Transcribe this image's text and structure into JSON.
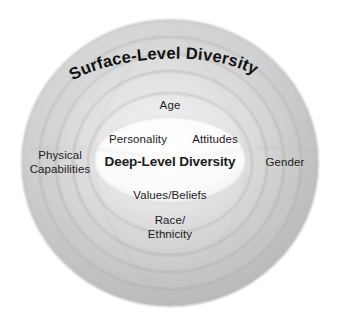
{
  "diagram": {
    "title_arc": "Surface-Level Diversity",
    "core_label": "Deep-Level Diversity",
    "inner_labels": {
      "top": "Age",
      "upper_left": "Personality",
      "upper_right": "Attitudes",
      "lower": "Values/Beliefs"
    },
    "outer_labels": {
      "left": "Physical\nCapabilities",
      "right": "Gender",
      "bottom": "Race/\nEthnicity"
    },
    "ring_count": 6,
    "colors": {
      "background": "#ffffff",
      "ring_light": "#dcdcdc",
      "ring_mid": "#c6c6c6",
      "ring_dark": "#b0b0b0",
      "ring_edge": "#949494",
      "core_fill": "#fbfbfb",
      "text": "#1b1b1b",
      "credit_text": "#6d6d6d"
    }
  },
  "credit": {
    "text": "© Susan Trigg/iStockphoto.com"
  }
}
